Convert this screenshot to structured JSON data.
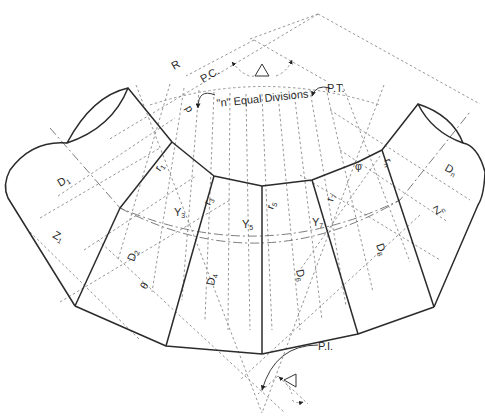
{
  "figure": {
    "labels": {
      "R": "R",
      "PC": "P.C.",
      "PT": "P.T.",
      "PI": "P.I.",
      "delta": "Δ",
      "divisions": "\"n\" Equal Divisions",
      "p": "p",
      "theta": "θ",
      "phi": "φ",
      "D1": {
        "base": "D",
        "sub": "1"
      },
      "D2": {
        "base": "D",
        "sub": "2"
      },
      "D4": {
        "base": "D",
        "sub": "4"
      },
      "D6": {
        "base": "D",
        "sub": "6"
      },
      "D8": {
        "base": "D",
        "sub": "8"
      },
      "Dn": {
        "base": "D",
        "sub": "n"
      },
      "r1": {
        "base": "r",
        "sub": "1"
      },
      "r3": {
        "base": "r",
        "sub": "3"
      },
      "r5": {
        "base": "r",
        "sub": "5"
      },
      "r7": {
        "base": "r",
        "sub": "7"
      },
      "rn": {
        "base": "r",
        "sub": "n"
      },
      "Y3": {
        "base": "Y",
        "sub": "3"
      },
      "Y5": {
        "base": "Y",
        "sub": "5"
      },
      "Y7": {
        "base": "Y",
        "sub": "7"
      },
      "Z1": {
        "base": "Z",
        "sub": "1"
      },
      "Zn": {
        "base": "Z",
        "sub": "n"
      }
    },
    "icons": [
      "delta-triangle-icon",
      "curved-leader-arrow-icon"
    ],
    "colors": {
      "line": "#2b2b2b",
      "construction": "#8a8a8a",
      "background": "#ffffff"
    }
  }
}
